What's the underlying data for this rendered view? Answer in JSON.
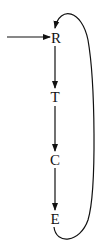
{
  "diagram": {
    "type": "flow-cycle",
    "nodes": [
      {
        "id": "R",
        "label": "R"
      },
      {
        "id": "T",
        "label": "T"
      },
      {
        "id": "C",
        "label": "C"
      },
      {
        "id": "E",
        "label": "E"
      }
    ],
    "edges": [
      {
        "from": "input",
        "to": "R"
      },
      {
        "from": "R",
        "to": "T"
      },
      {
        "from": "T",
        "to": "C"
      },
      {
        "from": "C",
        "to": "E"
      },
      {
        "from": "E",
        "to": "R",
        "style": "curved-loop"
      }
    ]
  }
}
